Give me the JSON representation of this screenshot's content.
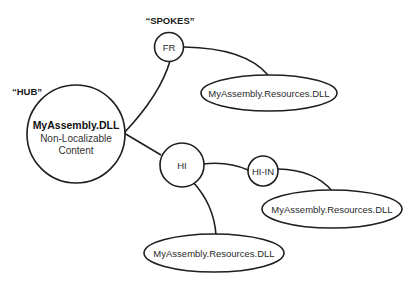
{
  "labels": {
    "spokes": "“SPOKES”",
    "hub": "“HUB”"
  },
  "hub": {
    "title": "MyAssembly.DLL",
    "line1": "Non-Localizable",
    "line2": "Content"
  },
  "nodes": {
    "fr": "FR",
    "hi": "HI",
    "hi_in": "HI-IN"
  },
  "resources": {
    "fr": "MyAssembly.Resources.DLL",
    "hi_in": "MyAssembly.Resources.DLL",
    "hi": "MyAssembly.Resources.DLL"
  },
  "colors": {
    "stroke": "#1e1e1e",
    "background": "#ffffff"
  }
}
